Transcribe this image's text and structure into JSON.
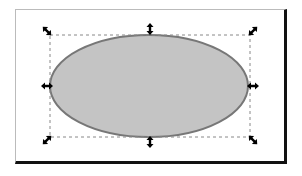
{
  "canvas": {
    "width": 302,
    "height": 176,
    "background": "#ffffff"
  },
  "frame": {
    "border_color": "#bbbbbb",
    "shadow_color": "#111111"
  },
  "shape": {
    "type": "ellipse",
    "fill": "#c4c4c4",
    "stroke": "#777777",
    "cx": 149,
    "cy": 86,
    "rx": 99,
    "ry": 51
  },
  "selection": {
    "bbox": {
      "x": 50,
      "y": 35,
      "width": 200,
      "height": 102
    },
    "style": "dashed",
    "handles": [
      "scale-nw",
      "scale-n",
      "scale-ne",
      "scale-w",
      "scale-e",
      "scale-sw",
      "scale-s",
      "scale-se"
    ]
  }
}
